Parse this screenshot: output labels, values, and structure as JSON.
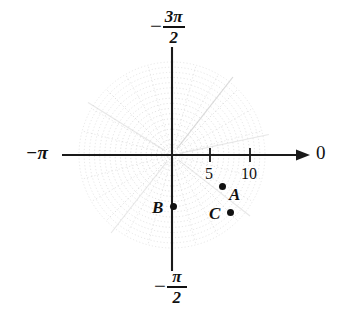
{
  "figure": {
    "type": "polar-coordinate-plot",
    "width": 347,
    "height": 312
  },
  "chart_data": {
    "type": "scatter",
    "coordinate_system": "polar",
    "title": "",
    "xlabel": "",
    "ylabel": "",
    "origin_px": [
      172,
      155
    ],
    "pixels_per_unit": 7.7,
    "axis_labels": {
      "right": "0",
      "left_minus": "−",
      "left_pi": "π",
      "top_minus": "−",
      "top_numerator": "3π",
      "top_denominator": "2",
      "bottom_minus": "−",
      "bottom_numerator": "π",
      "bottom_denominator": "2"
    },
    "radial_ticks": [
      {
        "label": "5",
        "value": 5,
        "x_px": 210
      },
      {
        "label": "10",
        "value": 10,
        "x_px": 250
      }
    ],
    "angular_axis": {
      "right_angle_label": "0",
      "left_angle_label": "−π",
      "top_angle_label": "−3π/2",
      "bottom_angle_label": "−π/2"
    },
    "points": [
      {
        "name": "A",
        "label": "A",
        "dot_x_px": 222,
        "dot_y_px": 186,
        "label_side": "right",
        "r": 8.5,
        "theta_deg": -21
      },
      {
        "name": "B",
        "label": "B",
        "dot_x_px": 173,
        "dot_y_px": 206,
        "label_side": "left",
        "r": 6.6,
        "theta_deg": -90
      },
      {
        "name": "C",
        "label": "C",
        "dot_x_px": 230,
        "dot_y_px": 212,
        "label_side": "left",
        "r": 10.2,
        "theta_deg": -34
      }
    ],
    "grid": {
      "visible": true,
      "style": "dotted",
      "color": "#c9c9c9",
      "circle_count": 18,
      "spoke_count": 24,
      "outer_radius_px": 93,
      "grid_on": true
    },
    "axis_color": "#1a1a1a",
    "point_color": "#111111",
    "legend": "none"
  }
}
